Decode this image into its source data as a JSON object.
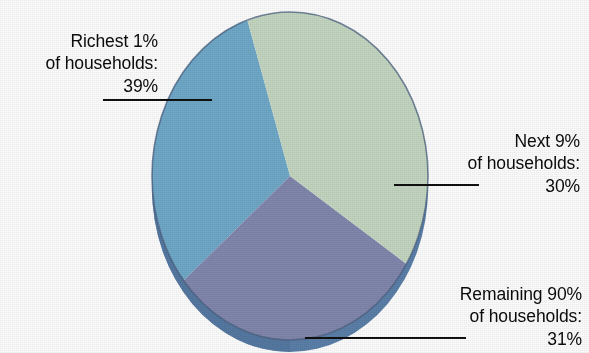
{
  "chart_data": {
    "type": "pie",
    "title": "",
    "subtitle": "",
    "xlabel": "",
    "ylabel": "",
    "legend_position": "callout-labels",
    "grid": false,
    "three_d": true,
    "categories": [
      "Richest 1% of households",
      "Next 9% of households",
      "Remaining 90% of households"
    ],
    "values": [
      39,
      30,
      31
    ],
    "value_labels": [
      "39%",
      "30%",
      "31%"
    ],
    "slices": [
      {
        "name": "Richest 1% of households",
        "value": 39,
        "value_label": "39%",
        "color": "#c3d6c0",
        "label_lines": [
          "Richest 1%",
          "of households:",
          "39%"
        ],
        "start_angle_deg": 251,
        "end_angle_deg": 111
      },
      {
        "name": "Next 9% of households",
        "value": 30,
        "value_label": "30%",
        "color": "#8186ad",
        "label_lines": [
          "Next 9%",
          "of households:",
          "30%"
        ],
        "start_angle_deg": 111,
        "end_angle_deg": 219
      },
      {
        "name": "Remaining 90% of households",
        "value": 31,
        "value_label": "31%",
        "color": "#6fa8c8",
        "label_lines": [
          "Remaining 90%",
          "of households:",
          "31%"
        ],
        "start_angle_deg": 219,
        "end_angle_deg": 251
      }
    ],
    "colors": {
      "slice_richest_1": "#c3d6c0",
      "slice_next_9": "#8186ad",
      "slice_remaining_90": "#6fa8c8",
      "pie_side_depth": "#5b7fa8",
      "outline": "#4a5f7e",
      "leader_line": "#101010",
      "text": "#0b0b0b",
      "background": "#fdfdfd"
    }
  },
  "labels": {
    "richest": {
      "line1": "Richest 1%",
      "line2": "of households:",
      "line3": "39%"
    },
    "next": {
      "line1": "Next 9%",
      "line2": "of households:",
      "line3": "30%"
    },
    "remaining": {
      "line1": "Remaining 90%",
      "line2": "of households:",
      "line3": "31%"
    }
  }
}
